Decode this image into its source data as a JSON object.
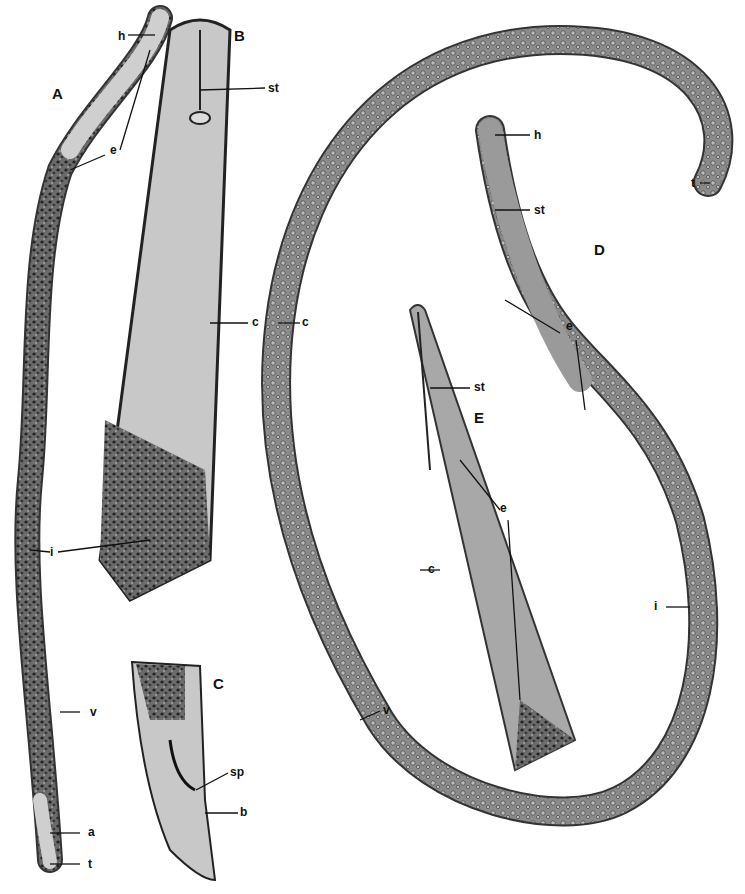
{
  "panels": {
    "A": "A",
    "B": "B",
    "C": "C",
    "D": "D",
    "E": "E"
  },
  "labels": {
    "A_h": "h",
    "A_e": "e",
    "A_i": "i",
    "A_v": "v",
    "A_a": "a",
    "A_t": "t",
    "B_st": "st",
    "B_c": "c",
    "C_sp": "sp",
    "C_b": "b",
    "D_h": "h",
    "D_st": "st",
    "D_e": "e",
    "D_t": "t",
    "D_i": "i",
    "D_v": "v",
    "D_c": "c",
    "E_st": "st",
    "E_e": "e",
    "E_c": "c"
  }
}
